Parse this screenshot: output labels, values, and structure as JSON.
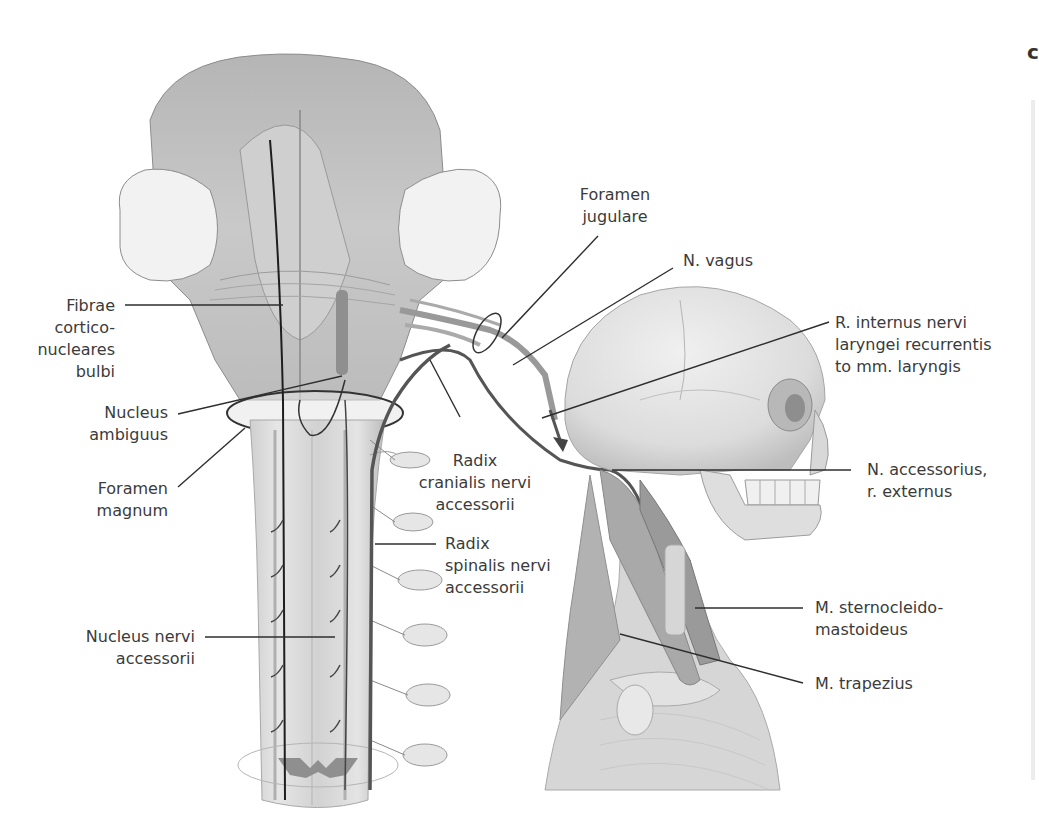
{
  "figure": {
    "panel_letter": "c",
    "colors": {
      "background": "#ffffff",
      "tissue_light": "#e4e4e4",
      "tissue_mid": "#bdbdbd",
      "tissue_dark": "#8a8a8a",
      "nerve": "#555555",
      "leader_line": "#2e2e2e",
      "label_text": "#3b3b3b"
    }
  },
  "labels": {
    "fibrae": [
      "Fibrae",
      "cortico-",
      "nucleares",
      "bulbi"
    ],
    "nucleus_ambiguus": [
      "Nucleus",
      "ambiguus"
    ],
    "foramen_magnum": [
      "Foramen",
      "magnum"
    ],
    "nucleus_nervi_accessorii": [
      "Nucleus nervi",
      "accessorii"
    ],
    "foramen_jugulare": [
      "Foramen",
      "jugulare"
    ],
    "n_vagus": [
      "N. vagus"
    ],
    "r_internus": [
      "R. internus nervi",
      "laryngei recurrentis",
      "to mm. laryngis"
    ],
    "radix_cranialis": [
      "Radix",
      "cranialis nervi",
      "accessorii"
    ],
    "radix_spinalis": [
      "Radix",
      "spinalis nervi",
      "accessorii"
    ],
    "n_accessorius": [
      "N. accessorius,",
      "r. externus"
    ],
    "m_sternocleido": [
      "M. sternocleido-",
      "mastoideus"
    ],
    "m_trapezius": [
      "M. trapezius"
    ]
  }
}
